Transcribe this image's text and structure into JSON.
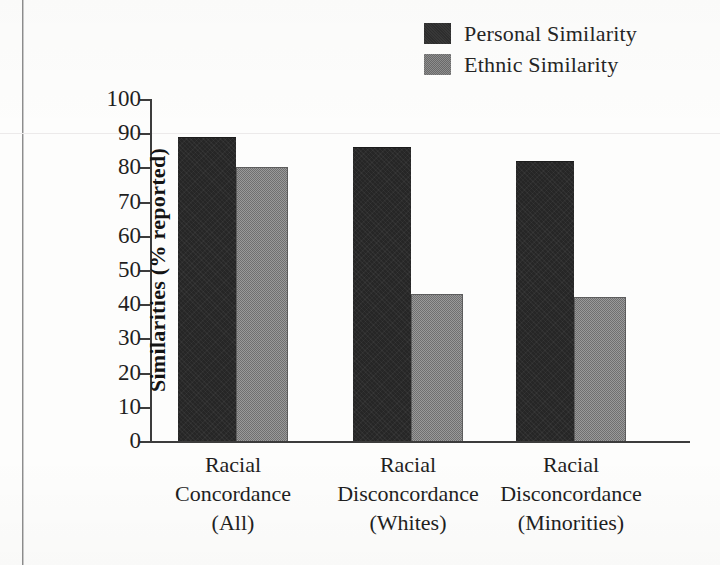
{
  "chart_data": {
    "type": "bar",
    "title": "",
    "xlabel": "",
    "ylabel": "Similarities (% reported)",
    "ylim": [
      0,
      100
    ],
    "yticks": [
      0,
      10,
      20,
      30,
      40,
      50,
      60,
      70,
      80,
      90,
      100
    ],
    "grid": false,
    "legend_position": "top-right",
    "categories": [
      "Racial\nConcordance\n(All)",
      "Racial\nDisconcordance\n(Whites)",
      "Racial\nDisconcordance\n(Minorities)"
    ],
    "category_lines": [
      [
        "Racial",
        "Concordance",
        "(All)"
      ],
      [
        "Racial",
        "Disconcordance",
        "(Whites)"
      ],
      [
        "Racial",
        "Disconcordance",
        "(Minorities)"
      ]
    ],
    "series": [
      {
        "name": "Personal Similarity",
        "color": "#262626",
        "values": [
          89,
          86,
          82
        ]
      },
      {
        "name": "Ethnic Similarity",
        "color": "#808080",
        "values": [
          80,
          43,
          42
        ]
      }
    ]
  },
  "legend": {
    "items": [
      {
        "label": "Personal Similarity",
        "swatch": "dark-square-swatch"
      },
      {
        "label": "Ethnic Similarity",
        "swatch": "gray-square-swatch"
      }
    ]
  },
  "axis": {
    "y_title": "Similarities (% reported)",
    "y_tick_labels": [
      "100",
      "90",
      "80",
      "70",
      "60",
      "50",
      "40",
      "30",
      "20",
      "10",
      "0"
    ]
  }
}
